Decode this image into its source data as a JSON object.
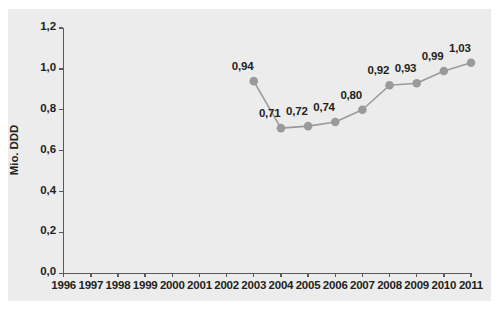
{
  "chart_data": {
    "type": "line",
    "title": "",
    "xlabel": "",
    "ylabel": "Mio. DDD",
    "grid": false,
    "legend": "none",
    "marker": "circle",
    "series_color": "#9a9a9a",
    "line_color": "#9a9a9a",
    "panel_color": "#ececec",
    "axis_color": "#58595b",
    "label_color": "#231f20",
    "x_ticks": [
      "1996",
      "1997",
      "1998",
      "1999",
      "2000",
      "2001",
      "2002",
      "2003",
      "2004",
      "2005",
      "2006",
      "2007",
      "2008",
      "2009",
      "2010",
      "2011"
    ],
    "y_ticks": [
      "0,0",
      "0,2",
      "0,4",
      "0,6",
      "0,8",
      "1,0",
      "1,2"
    ],
    "ylim": [
      0,
      1.2
    ],
    "xlim": [
      1996,
      2011
    ],
    "categories": [
      2003,
      2004,
      2005,
      2006,
      2007,
      2008,
      2009,
      2010,
      2011
    ],
    "values": [
      0.94,
      0.71,
      0.72,
      0.74,
      0.8,
      0.92,
      0.93,
      0.99,
      1.03
    ],
    "point_labels": [
      "0,94",
      "0,71",
      "0,72",
      "0,74",
      "0,80",
      "0,92",
      "0,93",
      "0,99",
      "1,03"
    ]
  }
}
